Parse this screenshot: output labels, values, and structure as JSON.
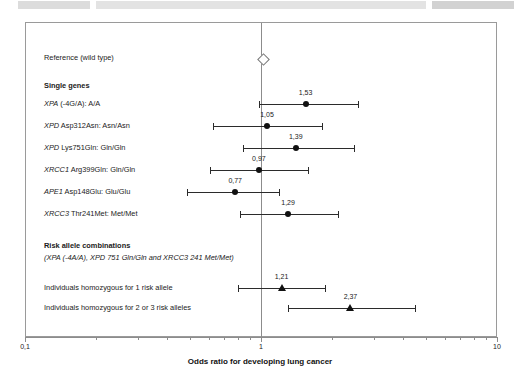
{
  "scan_artifact": {
    "ghost_text": ""
  },
  "chart_data": {
    "type": "forest",
    "title": "",
    "xlabel": "Odds ratio for developing lung cancer",
    "ylabel": "",
    "xscale": "log",
    "xlim": [
      0.1,
      10
    ],
    "xticks_major": [
      0.1,
      1,
      10
    ],
    "xtick_labels": [
      "0,1",
      "1",
      "10"
    ],
    "reference_line": 1,
    "grid": false,
    "legend": "none",
    "decimal_separator": ",",
    "sections": [
      {
        "kind": "reference",
        "label": "Reference (wild type)"
      },
      {
        "kind": "heading",
        "label": "Single genes"
      },
      {
        "kind": "heading",
        "label": "Risk allele combinations"
      },
      {
        "kind": "subheading",
        "label": "(XPA (-4A/A), XPD 751 Gln/Gln and XRCC3 241 Met/Met)"
      }
    ],
    "rows": [
      {
        "id": "reference",
        "label": "Reference (wild type)",
        "label_plain": "Reference (wild type)",
        "gene": "",
        "marker": "diamond-open",
        "or": 1.0,
        "or_label": "",
        "ci_low": 1.0,
        "ci_high": 1.0
      },
      {
        "id": "xpa-4ga",
        "gene": "XPA",
        "label_rest": " (-4G/A):  A/A",
        "marker": "circle",
        "or": 1.53,
        "or_label": "1,53",
        "ci_low": 0.97,
        "ci_high": 2.58
      },
      {
        "id": "xpd-asp312asn",
        "gene": "XPD",
        "label_rest": " Asp312Asn:  Asn/Asn",
        "marker": "circle",
        "or": 1.05,
        "or_label": "1,05",
        "ci_low": 0.62,
        "ci_high": 1.82
      },
      {
        "id": "xpd-lys751gln",
        "gene": "XPD",
        "label_rest": " Lys751Gln:  Gln/Gln",
        "marker": "circle",
        "or": 1.39,
        "or_label": "1,39",
        "ci_low": 0.83,
        "ci_high": 2.47
      },
      {
        "id": "xrcc1-arg399gln",
        "gene": "XRCC1",
        "label_rest": " Arg399Gln:  Gln/Gln",
        "marker": "circle",
        "or": 0.97,
        "or_label": "0,97",
        "ci_low": 0.6,
        "ci_high": 1.58
      },
      {
        "id": "ape1-asp148glu",
        "gene": "APE1",
        "label_rest": " Asp148Glu:  Glu/Glu",
        "marker": "circle",
        "or": 0.77,
        "or_label": "0,77",
        "ci_low": 0.48,
        "ci_high": 1.19
      },
      {
        "id": "xrcc3-thr241met",
        "gene": "XRCC3",
        "label_rest": " Thr241Met:  Met/Met",
        "marker": "circle",
        "or": 1.29,
        "or_label": "1,29",
        "ci_low": 0.81,
        "ci_high": 2.12
      },
      {
        "id": "homozygous-1-allele",
        "gene": "",
        "label_plain": "Individuals homozygous for 1 risk allele",
        "marker": "triangle",
        "or": 1.21,
        "or_label": "1,21",
        "ci_low": 0.79,
        "ci_high": 1.87
      },
      {
        "id": "homozygous-2-or-3-alleles",
        "gene": "",
        "label_plain": "Individuals homozygous for 2 or 3 risk alleles",
        "marker": "triangle",
        "or": 2.37,
        "or_label": "2,37",
        "ci_low": 1.29,
        "ci_high": 4.49
      }
    ]
  },
  "labels": {
    "reference": "Reference (wild type)",
    "single_genes": "Single genes",
    "risk_combinations": "Risk allele combinations",
    "risk_combinations_detail": "(XPA (-4A/A), XPD 751 Gln/Gln and XRCC3 241 Met/Met)",
    "row_xpa": {
      "gene": "XPA",
      "rest": " (-4G/A):  A/A"
    },
    "row_xpd312": {
      "gene": "XPD",
      "rest": " Asp312Asn:  Asn/Asn"
    },
    "row_xpd751": {
      "gene": "XPD",
      "rest": " Lys751Gln:  Gln/Gln"
    },
    "row_xrcc1": {
      "gene": "XRCC1",
      "rest": " Arg399Gln:  Gln/Gln"
    },
    "row_ape1": {
      "gene": "APE1",
      "rest": " Asp148Glu:  Glu/Glu"
    },
    "row_xrcc3": {
      "gene": "XRCC3",
      "rest": " Thr241Met:  Met/Met"
    },
    "row_homo1": "Individuals homozygous for 1 risk allele",
    "row_homo23": "Individuals homozygous for 2 or 3 risk alleles"
  },
  "axis": {
    "title": "Odds ratio for developing lung cancer",
    "tick_low": "0,1",
    "tick_mid": "1",
    "tick_high": "10"
  },
  "values": {
    "v_xpa": "1,53",
    "v_xpd312": "1,05",
    "v_xpd751": "1,39",
    "v_xrcc1": "0,97",
    "v_ape1": "0,77",
    "v_xrcc3": "1,29",
    "v_homo1": "1,21",
    "v_homo23": "2,37"
  }
}
